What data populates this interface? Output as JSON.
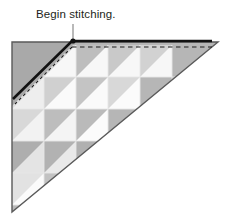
{
  "figure": {
    "kind": "quilting-diagram",
    "annotation": {
      "text": "Begin stitching.",
      "leader_line": "vertical pointer from label down to the stitch start point"
    },
    "colors": {
      "background": "#ffffff",
      "dark_gray": "#a8a8a8",
      "mid_gray": "#bfbfbf",
      "light_gray": "#dcdcdc",
      "pale_gray": "#eeeeee",
      "white_patch": "#fbfbfb",
      "outline": "#4d4d4d",
      "stitch_line": "#111111",
      "dashed_line": "#1a1a1a",
      "text": "#231f20"
    },
    "geometry": {
      "grid_cell_px": 32,
      "grid_origin_x": 12,
      "grid_origin_y": 45,
      "columns": 6,
      "rows": 5,
      "triangle_apex_right_x": 218,
      "triangle_top_y": 42,
      "triangle_bottom_left_y": 212
    },
    "elements": [
      {
        "name": "solid-dark-triangle",
        "label": "folded dark fabric wedge, upper-left"
      },
      {
        "name": "hst-grid",
        "label": "grid of half-square triangle units"
      },
      {
        "name": "dashed-stitch-guide",
        "label": "dashed sewing guideline along top edge"
      },
      {
        "name": "bold-stitch-path",
        "label": "bold diagonal stitching line"
      },
      {
        "name": "stitch-start-marker",
        "label": "start point of stitching"
      },
      {
        "name": "outer-triangle-outline",
        "label": "outline of the large triangle"
      }
    ],
    "hst_rows": [
      {
        "row": 1,
        "cells": [
          "light",
          "light",
          "light",
          "light",
          "dark-partial",
          "none"
        ]
      },
      {
        "row": 2,
        "cells": [
          "pale",
          "light",
          "light",
          "light",
          "dark",
          "none"
        ]
      },
      {
        "row": 3,
        "cells": [
          "light",
          "light",
          "light",
          "dark",
          "none",
          "none"
        ]
      },
      {
        "row": 4,
        "cells": [
          "dark",
          "dark",
          "dark",
          "none",
          "none",
          "none"
        ]
      },
      {
        "row": 5,
        "cells": [
          "pale",
          "light",
          "none",
          "none",
          "none",
          "none"
        ]
      }
    ]
  }
}
